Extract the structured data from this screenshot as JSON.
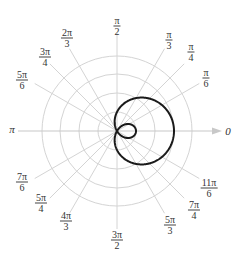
{
  "chart_data": {
    "type": "polar-line",
    "title": "",
    "equation_inferred": "r = 1 + 2cos(theta)",
    "center_px": [
      117,
      131
    ],
    "unit_px": 19,
    "grid": {
      "circles": [
        1,
        2,
        3,
        4
      ],
      "rays_visible": true
    },
    "series": [
      {
        "name": "limacon with inner loop",
        "color": "#1a1a1a",
        "rmax_at_0": 3,
        "inner_loop_rmax": 1
      }
    ],
    "angle_labels": [
      {
        "id": "a0",
        "num": "",
        "den": "",
        "text": "0",
        "x": 228,
        "y": 131
      },
      {
        "id": "a30",
        "num": "π",
        "den": "6",
        "x": 206,
        "y": 78
      },
      {
        "id": "a45",
        "num": "π",
        "den": "4",
        "x": 191,
        "y": 52
      },
      {
        "id": "a60",
        "num": "π",
        "den": "3",
        "x": 169,
        "y": 40
      },
      {
        "id": "a90",
        "num": "π",
        "den": "2",
        "x": 117,
        "y": 26
      },
      {
        "id": "a120",
        "num": "2π",
        "den": "3",
        "x": 67,
        "y": 38
      },
      {
        "id": "a135",
        "num": "3π",
        "den": "4",
        "x": 45,
        "y": 57
      },
      {
        "id": "a150",
        "num": "5π",
        "den": "6",
        "x": 22,
        "y": 80
      },
      {
        "id": "a180",
        "num": "",
        "den": "",
        "text": "π",
        "x": 12,
        "y": 129
      },
      {
        "id": "a210",
        "num": "7π",
        "den": "6",
        "x": 22,
        "y": 182
      },
      {
        "id": "a225",
        "num": "5π",
        "den": "4",
        "x": 41,
        "y": 203
      },
      {
        "id": "a240",
        "num": "4π",
        "den": "3",
        "x": 66,
        "y": 221
      },
      {
        "id": "a270",
        "num": "3π",
        "den": "2",
        "x": 117,
        "y": 240
      },
      {
        "id": "a300",
        "num": "5π",
        "den": "3",
        "x": 170,
        "y": 225
      },
      {
        "id": "a315",
        "num": "7π",
        "den": "4",
        "x": 194,
        "y": 210
      },
      {
        "id": "a330",
        "num": "11π",
        "den": "6",
        "x": 209,
        "y": 188
      }
    ]
  },
  "colors": {
    "grid": "#d4d4d4",
    "axis": "#c8c8c8",
    "curve": "#1a1a1a",
    "label": "#333333"
  }
}
